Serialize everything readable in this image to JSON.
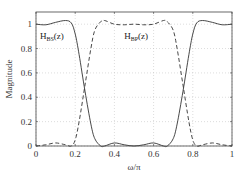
{
  "chart_data": {
    "type": "line",
    "title": "",
    "xlabel": "ω/π",
    "ylabel": "Magnitude",
    "xlim": [
      0,
      1
    ],
    "ylim": [
      0,
      1.1
    ],
    "grid": true,
    "xticks": [
      "0",
      "0.2",
      "0.4",
      "0.6",
      "0.8",
      "1"
    ],
    "yticks": [
      "0",
      "0.2",
      "0.4",
      "0.6",
      "0.8",
      "1"
    ],
    "series": [
      {
        "name": "H_BS(z)",
        "style": "solid",
        "x": [
          0,
          0.05,
          0.1,
          0.15,
          0.18,
          0.2,
          0.22,
          0.25,
          0.28,
          0.3,
          0.33,
          0.35,
          0.4,
          0.45,
          0.5,
          0.55,
          0.6,
          0.65,
          0.67,
          0.7,
          0.72,
          0.75,
          0.78,
          0.8,
          0.82,
          0.85,
          0.9,
          0.95,
          1.0
        ],
        "values": [
          1.0,
          0.995,
          1.015,
          1.03,
          1.01,
          0.92,
          0.75,
          0.45,
          0.18,
          0.06,
          0.0,
          0.0,
          0.025,
          0.01,
          0.0,
          0.01,
          0.025,
          0.0,
          0.0,
          0.06,
          0.18,
          0.45,
          0.75,
          0.92,
          1.01,
          1.03,
          1.015,
          0.995,
          1.0
        ]
      },
      {
        "name": "H_BP(z)",
        "style": "dashed",
        "x": [
          0,
          0.05,
          0.1,
          0.15,
          0.18,
          0.2,
          0.22,
          0.25,
          0.28,
          0.3,
          0.33,
          0.35,
          0.4,
          0.45,
          0.5,
          0.55,
          0.6,
          0.65,
          0.67,
          0.7,
          0.72,
          0.75,
          0.78,
          0.8,
          0.82,
          0.85,
          0.9,
          0.95,
          1.0
        ],
        "values": [
          0.0,
          0.01,
          0.025,
          0.01,
          0.0,
          0.05,
          0.2,
          0.5,
          0.8,
          0.95,
          1.02,
          1.03,
          1.0,
          0.995,
          1.0,
          0.995,
          1.0,
          1.03,
          1.02,
          0.95,
          0.8,
          0.5,
          0.2,
          0.05,
          0.0,
          0.01,
          0.025,
          0.01,
          0.0
        ]
      }
    ],
    "annotations": [
      {
        "text": "H",
        "sub": "BS",
        "suffix": "(z)",
        "x": 0.01,
        "y": 0.88
      },
      {
        "text": "H",
        "sub": "BP",
        "suffix": "(z)",
        "x": 0.44,
        "y": 0.88
      }
    ]
  }
}
